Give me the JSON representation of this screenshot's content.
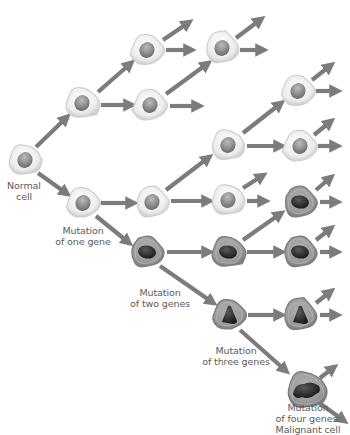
{
  "diagram": {
    "colors": {
      "arrow": "#7c7c7c",
      "normal_cell_fill": "#eeeeee",
      "normal_cell_edge": "#cfcfcf",
      "normal_nucleus": "#8a8a8a",
      "mutated_cell_fill": "#9a9a9a",
      "mutated_cell_edge": "#7a7a7a",
      "mutated_nucleus": "#2a2a2a"
    },
    "labels": {
      "normal": [
        "Normal",
        "cell"
      ],
      "one_gene": [
        "Mutation",
        "of one gene"
      ],
      "two_genes": [
        "Mutation",
        "of two genes"
      ],
      "three_genes": [
        "Mutation",
        "of three genes"
      ],
      "four_genes": [
        "Mutation",
        "of four genes:",
        "Malignant cell"
      ]
    },
    "cells": [
      {
        "id": "normal",
        "x": 25,
        "y": 160,
        "type": "normal",
        "stage": "Normal cell"
      },
      {
        "id": "c2a",
        "x": 82,
        "y": 103,
        "type": "normal"
      },
      {
        "id": "c2b",
        "x": 83,
        "y": 203,
        "type": "normal",
        "stage": "Mutation of one gene"
      },
      {
        "id": "c3a",
        "x": 147,
        "y": 50,
        "type": "normal"
      },
      {
        "id": "c3b",
        "x": 150,
        "y": 105,
        "type": "normal"
      },
      {
        "id": "c3c",
        "x": 152,
        "y": 202,
        "type": "normal"
      },
      {
        "id": "c3d",
        "x": 147,
        "y": 252,
        "type": "mutated2",
        "stage": "Mutation of two genes"
      },
      {
        "id": "c4a",
        "x": 222,
        "y": 48,
        "type": "normal"
      },
      {
        "id": "c4b",
        "x": 228,
        "y": 145,
        "type": "normal"
      },
      {
        "id": "c4c",
        "x": 228,
        "y": 200,
        "type": "normal"
      },
      {
        "id": "c4d",
        "x": 228,
        "y": 252,
        "type": "mutated2"
      },
      {
        "id": "c4e",
        "x": 229,
        "y": 315,
        "type": "mutated3",
        "stage": "Mutation of three genes"
      },
      {
        "id": "c5a",
        "x": 298,
        "y": 91,
        "type": "normal"
      },
      {
        "id": "c5b",
        "x": 300,
        "y": 146,
        "type": "normal"
      },
      {
        "id": "c5c",
        "x": 300,
        "y": 202,
        "type": "mutated2"
      },
      {
        "id": "c5d",
        "x": 300,
        "y": 252,
        "type": "mutated2"
      },
      {
        "id": "c5e",
        "x": 300,
        "y": 315,
        "type": "mutated3"
      },
      {
        "id": "c5f",
        "x": 307,
        "y": 390,
        "type": "malignant",
        "stage": "Mutation of four genes: Malignant cell"
      }
    ],
    "arrows": [
      {
        "x1": 36,
        "y1": 147,
        "x2": 66,
        "y2": 118
      },
      {
        "x1": 38,
        "y1": 173,
        "x2": 66,
        "y2": 193
      },
      {
        "x1": 98,
        "y1": 92,
        "x2": 130,
        "y2": 64
      },
      {
        "x1": 101,
        "y1": 105,
        "x2": 130,
        "y2": 105
      },
      {
        "x1": 101,
        "y1": 203,
        "x2": 132,
        "y2": 203
      },
      {
        "x1": 96,
        "y1": 216,
        "x2": 128,
        "y2": 242
      },
      {
        "x1": 163,
        "y1": 40,
        "x2": 188,
        "y2": 23
      },
      {
        "x1": 166,
        "y1": 50,
        "x2": 190,
        "y2": 50
      },
      {
        "x1": 166,
        "y1": 94,
        "x2": 207,
        "y2": 64
      },
      {
        "x1": 170,
        "y1": 106,
        "x2": 198,
        "y2": 106
      },
      {
        "x1": 166,
        "y1": 190,
        "x2": 208,
        "y2": 158
      },
      {
        "x1": 171,
        "y1": 201,
        "x2": 208,
        "y2": 201
      },
      {
        "x1": 167,
        "y1": 252,
        "x2": 208,
        "y2": 252
      },
      {
        "x1": 160,
        "y1": 266,
        "x2": 212,
        "y2": 302
      },
      {
        "x1": 236,
        "y1": 38,
        "x2": 260,
        "y2": 20
      },
      {
        "x1": 240,
        "y1": 50,
        "x2": 262,
        "y2": 50
      },
      {
        "x1": 243,
        "y1": 133,
        "x2": 280,
        "y2": 104
      },
      {
        "x1": 247,
        "y1": 146,
        "x2": 280,
        "y2": 146
      },
      {
        "x1": 243,
        "y1": 188,
        "x2": 262,
        "y2": 176
      },
      {
        "x1": 247,
        "y1": 201,
        "x2": 264,
        "y2": 201
      },
      {
        "x1": 243,
        "y1": 240,
        "x2": 280,
        "y2": 214
      },
      {
        "x1": 247,
        "y1": 252,
        "x2": 280,
        "y2": 252
      },
      {
        "x1": 248,
        "y1": 315,
        "x2": 280,
        "y2": 315
      },
      {
        "x1": 240,
        "y1": 330,
        "x2": 285,
        "y2": 370
      },
      {
        "x1": 312,
        "y1": 80,
        "x2": 330,
        "y2": 66
      },
      {
        "x1": 316,
        "y1": 91,
        "x2": 336,
        "y2": 91
      },
      {
        "x1": 314,
        "y1": 135,
        "x2": 330,
        "y2": 122
      },
      {
        "x1": 318,
        "y1": 146,
        "x2": 336,
        "y2": 146
      },
      {
        "x1": 316,
        "y1": 190,
        "x2": 330,
        "y2": 178
      },
      {
        "x1": 320,
        "y1": 202,
        "x2": 336,
        "y2": 202
      },
      {
        "x1": 316,
        "y1": 240,
        "x2": 330,
        "y2": 229
      },
      {
        "x1": 320,
        "y1": 252,
        "x2": 336,
        "y2": 252
      },
      {
        "x1": 316,
        "y1": 303,
        "x2": 330,
        "y2": 292
      },
      {
        "x1": 320,
        "y1": 315,
        "x2": 336,
        "y2": 315
      },
      {
        "x1": 320,
        "y1": 378,
        "x2": 333,
        "y2": 368
      },
      {
        "x1": 318,
        "y1": 402,
        "x2": 343,
        "y2": 420
      }
    ]
  }
}
